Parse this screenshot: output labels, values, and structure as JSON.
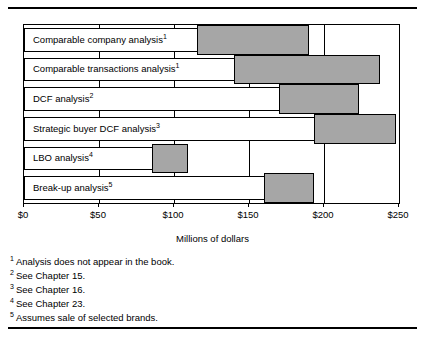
{
  "figure": {
    "axis_title": "Millions of dollars",
    "tick_labels": [
      "$0",
      "$50",
      "$100",
      "$150",
      "$200",
      "$250"
    ],
    "ticks": [
      0,
      50,
      100,
      150,
      200,
      250
    ],
    "rows": [
      {
        "label": "Comparable company analysis",
        "footnote_marker": "1",
        "low": 115,
        "high": 190
      },
      {
        "label": "Comparable transactions analysis",
        "footnote_marker": "1",
        "low": 140,
        "high": 237
      },
      {
        "label": "DCF analysis",
        "footnote_marker": "2",
        "low": 170,
        "high": 223
      },
      {
        "label": "Strategic buyer DCF analysis",
        "footnote_marker": "3",
        "low": 193,
        "high": 248
      },
      {
        "label": "LBO analysis",
        "footnote_marker": "4",
        "low": 85,
        "high": 109
      },
      {
        "label": "Break-up analysis",
        "footnote_marker": "5",
        "low": 160,
        "high": 193
      }
    ],
    "footnotes": [
      {
        "marker": "1",
        "text": "Analysis does not appear in the book."
      },
      {
        "marker": "2",
        "text": "See Chapter 15."
      },
      {
        "marker": "3",
        "text": "See Chapter 16."
      },
      {
        "marker": "4",
        "text": "See Chapter 23."
      },
      {
        "marker": "5",
        "text": "Assumes sale of selected brands."
      }
    ],
    "colors": {
      "bar_fill": "#a6a6a6",
      "bar_stroke": "#000000",
      "background": "#ffffff",
      "text": "#000000"
    }
  },
  "chart_data": {
    "type": "bar",
    "orientation": "horizontal",
    "subtype": "range-bar",
    "title": "",
    "xlabel": "Millions of dollars",
    "ylabel": "",
    "xlim": [
      0,
      250
    ],
    "xticks": [
      0,
      50,
      100,
      150,
      200,
      250
    ],
    "xtick_labels": [
      "$0",
      "$50",
      "$100",
      "$150",
      "$200",
      "$250"
    ],
    "grid": true,
    "legend": "none",
    "categories": [
      "Comparable company analysis",
      "Comparable transactions analysis",
      "DCF analysis",
      "Strategic buyer DCF analysis",
      "LBO analysis",
      "Break-up analysis"
    ],
    "series": [
      {
        "name": "Low",
        "values": [
          115,
          140,
          170,
          193,
          85,
          160
        ]
      },
      {
        "name": "High",
        "values": [
          190,
          237,
          223,
          248,
          109,
          193
        ]
      }
    ],
    "annotations": [
      "1 Analysis does not appear in the book.",
      "2 See Chapter 15.",
      "3 See Chapter 16.",
      "4 See Chapter 23.",
      "5 Assumes sale of selected brands."
    ]
  }
}
